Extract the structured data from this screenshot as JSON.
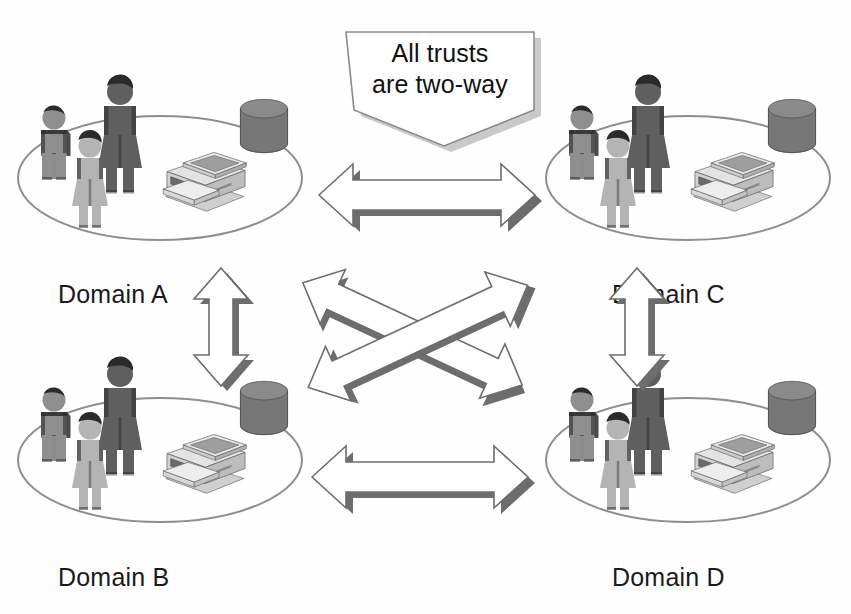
{
  "diagram": {
    "background_color": "#fefefe",
    "callout": {
      "line1": "All trusts",
      "line2": "are two-way",
      "shape": "pentagon-callout",
      "fill": "#ffffff",
      "stroke": "#8a8a8a",
      "shadow": "#c9c9c9"
    },
    "domains": [
      {
        "id": "a",
        "label": "Domain A",
        "position": "top-left"
      },
      {
        "id": "b",
        "label": "Domain B",
        "position": "bottom-left"
      },
      {
        "id": "c",
        "label": "Domain C",
        "position": "top-right"
      },
      {
        "id": "d",
        "label": "Domain D",
        "position": "bottom-right"
      }
    ],
    "trusts": [
      {
        "id": "a-c",
        "from": "Domain A",
        "to": "Domain C",
        "direction": "two-way",
        "orientation": "horizontal"
      },
      {
        "id": "b-d",
        "from": "Domain B",
        "to": "Domain D",
        "direction": "two-way",
        "orientation": "horizontal"
      },
      {
        "id": "a-b",
        "from": "Domain A",
        "to": "Domain B",
        "direction": "two-way",
        "orientation": "vertical"
      },
      {
        "id": "c-d",
        "from": "Domain C",
        "to": "Domain D",
        "direction": "two-way",
        "orientation": "vertical"
      },
      {
        "id": "a-d",
        "from": "Domain A",
        "to": "Domain D",
        "direction": "two-way",
        "orientation": "diagonal-down"
      },
      {
        "id": "b-c",
        "from": "Domain B",
        "to": "Domain C",
        "direction": "two-way",
        "orientation": "diagonal-up"
      }
    ],
    "domain_contents": {
      "users_icon": "people-group-icon",
      "database_icon": "database-cylinder-icon",
      "printer_icon": "printer-copier-icon",
      "platform_icon": "ellipse-platform-icon"
    },
    "colors": {
      "arrow_fill": "#ffffff",
      "arrow_stroke": "#6d6d6d",
      "arrow_shadow": "#6a6a6a",
      "person_dark": "#5f5f5f",
      "person_mid": "#8f8f8f",
      "person_light": "#b4b4b4",
      "hair": "#2b2b2b",
      "database_top": "#8a8a8a",
      "database_body": "#777777",
      "printer_body": "#dedede",
      "printer_side": "#bdbdbd",
      "printer_glass": "#9e9e9e",
      "printer_panel": "#6a6a6a",
      "platform_stroke": "#8e8e8e",
      "label_color": "#1a1a1a"
    }
  }
}
